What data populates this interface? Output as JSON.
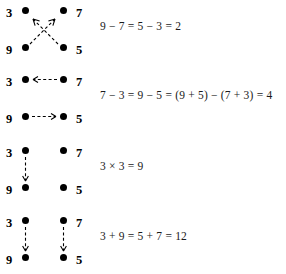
{
  "figure": {
    "background_color": "#ffffff",
    "dot_color": "#000000",
    "arrow_color": "#000000",
    "arrow_style": "dashed",
    "rows": [
      {
        "name": "row-crossing-arrows",
        "labels": {
          "top_left": "3",
          "top_right": "7",
          "bottom_left": "9",
          "bottom_right": "5"
        },
        "arrows": [
          "bottom-right-to-top-left",
          "bottom-left-to-top-right"
        ],
        "equation": "9 − 7 = 5 − 3 = 2"
      },
      {
        "name": "row-horizontal-arrows",
        "labels": {
          "top_left": "3",
          "top_right": "7",
          "bottom_left": "9",
          "bottom_right": "5"
        },
        "arrows": [
          "top-right-to-top-left",
          "bottom-left-to-bottom-right"
        ],
        "equation": "7 − 3 = 9 − 5 = (9 + 5) − (7 + 3) = 4"
      },
      {
        "name": "row-single-vertical-arrow",
        "labels": {
          "top_left": "3",
          "top_right": "7",
          "bottom_left": "9",
          "bottom_right": "5"
        },
        "arrows": [
          "left-top-to-left-bottom"
        ],
        "equation": "3 × 3 = 9"
      },
      {
        "name": "row-double-vertical-arrows",
        "labels": {
          "top_left": "3",
          "top_right": "7",
          "bottom_left": "9",
          "bottom_right": "5"
        },
        "arrows": [
          "left-top-to-left-bottom",
          "right-top-to-right-bottom"
        ],
        "equation": "3 + 9 = 5 + 7 = 12"
      }
    ]
  }
}
